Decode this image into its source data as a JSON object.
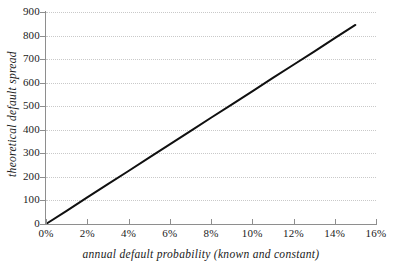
{
  "chart_data": {
    "type": "line",
    "title": "",
    "xlabel": "annual default probability (known and constant)",
    "ylabel": "theoretical default spread",
    "xlim": [
      0,
      16
    ],
    "ylim": [
      0,
      900
    ],
    "grid": "horizontal-dotted",
    "legend": "none",
    "x_tick_labels": [
      "0%",
      "2%",
      "4%",
      "6%",
      "8%",
      "10%",
      "12%",
      "14%",
      "16%"
    ],
    "x_tick_values": [
      0,
      2,
      4,
      6,
      8,
      10,
      12,
      14,
      16
    ],
    "y_tick_labels": [
      "0",
      "100",
      "200",
      "300",
      "400",
      "500",
      "600",
      "700",
      "800",
      "900"
    ],
    "y_tick_values": [
      0,
      100,
      200,
      300,
      400,
      500,
      600,
      700,
      800,
      900
    ],
    "series": [
      {
        "name": "theoretical default spread",
        "color": "#101010",
        "line_width": 2,
        "x": [
          0,
          1,
          2,
          3,
          4,
          5,
          6,
          7,
          8,
          9,
          10,
          11,
          12,
          13,
          14,
          15
        ],
        "values": [
          0,
          56,
          113,
          169,
          225,
          282,
          338,
          394,
          451,
          507,
          563,
          620,
          676,
          732,
          789,
          845
        ]
      }
    ]
  },
  "axes": {
    "x_title": "annual default probability (known and constant)",
    "y_title": "theoretical default spread"
  },
  "colors": {
    "series_line": "#101010",
    "gridline": "#c9c9c9",
    "axis_line": "#8e8e8e",
    "background": "#ffffff",
    "text": "#1a1a1a"
  }
}
